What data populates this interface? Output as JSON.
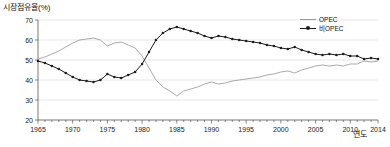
{
  "chart_data": {
    "type": "line",
    "title": "",
    "ylabel": "시장점유율(%)",
    "xlabel": "연도",
    "ylim": [
      20,
      70
    ],
    "yticks": [
      20,
      30,
      40,
      50,
      60,
      70
    ],
    "xlim": [
      1965,
      2014
    ],
    "xticks": [
      1965,
      1970,
      1975,
      1980,
      1985,
      1990,
      1995,
      2000,
      2005,
      2010,
      2014
    ],
    "grid": true,
    "legend_position": "top-right",
    "x": [
      1965,
      1966,
      1967,
      1968,
      1969,
      1970,
      1971,
      1972,
      1973,
      1974,
      1975,
      1976,
      1977,
      1978,
      1979,
      1980,
      1981,
      1982,
      1983,
      1984,
      1985,
      1986,
      1987,
      1988,
      1989,
      1990,
      1991,
      1992,
      1993,
      1994,
      1995,
      1996,
      1997,
      1998,
      1999,
      2000,
      2001,
      2002,
      2003,
      2004,
      2005,
      2006,
      2007,
      2008,
      2009,
      2010,
      2011,
      2012,
      2013,
      2014
    ],
    "series": [
      {
        "name": "OPEC",
        "color": "#9a9a9a",
        "marker": "none",
        "values": [
          50.5,
          51.5,
          53.0,
          54.5,
          56.5,
          58.5,
          60.0,
          60.5,
          61.0,
          60.0,
          57.0,
          58.5,
          59.0,
          57.5,
          56.0,
          52.0,
          46.0,
          40.0,
          36.5,
          34.5,
          32.0,
          34.5,
          35.5,
          36.5,
          38.0,
          39.0,
          38.0,
          38.5,
          39.5,
          40.0,
          40.5,
          41.0,
          41.5,
          42.5,
          43.0,
          44.0,
          44.5,
          43.5,
          45.0,
          46.0,
          47.0,
          47.5,
          47.0,
          47.5,
          47.0,
          48.0,
          48.0,
          49.5,
          49.0,
          49.5
        ]
      },
      {
        "name": "비OPEC",
        "color": "#1c1c1c",
        "marker": "circle",
        "values": [
          49.5,
          48.5,
          47.0,
          45.5,
          43.5,
          41.5,
          40.0,
          39.5,
          39.0,
          40.0,
          43.0,
          41.5,
          41.0,
          42.5,
          44.0,
          48.0,
          54.0,
          60.0,
          63.5,
          65.5,
          66.5,
          65.5,
          64.5,
          63.5,
          62.0,
          61.0,
          62.0,
          61.5,
          60.5,
          60.0,
          59.5,
          59.0,
          58.5,
          57.5,
          57.0,
          56.0,
          55.5,
          56.5,
          55.0,
          54.0,
          53.0,
          52.5,
          53.0,
          52.5,
          53.0,
          52.0,
          52.0,
          50.5,
          51.0,
          50.5
        ]
      }
    ]
  },
  "legend": {
    "items": [
      {
        "label": "OPEC"
      },
      {
        "label": "비OPEC"
      }
    ]
  }
}
